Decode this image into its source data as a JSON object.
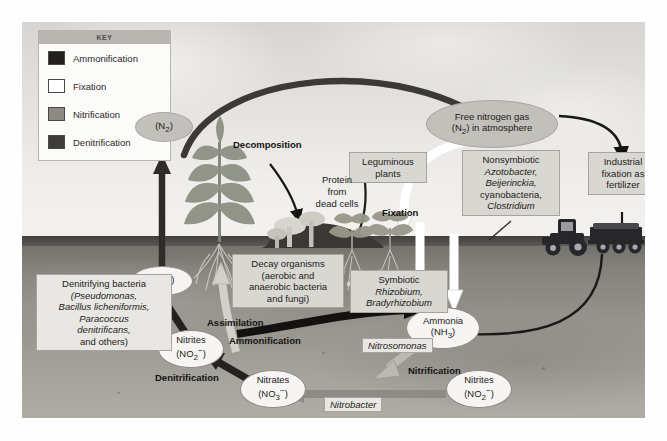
{
  "figure": {
    "key": {
      "title": "KEY",
      "items": [
        {
          "label": "Ammonification",
          "color": "#222120"
        },
        {
          "label": "Fixation",
          "color": "#ffffff"
        },
        {
          "label": "Nitrification",
          "color": "#8d8a85"
        },
        {
          "label": "Denitrification",
          "color": "#3f3d3a"
        }
      ]
    },
    "nodes": {
      "free_nitrogen": "Free nitrogen gas\n(N2) in atmosphere",
      "free_nitrogen_l1": "Free nitrogen gas",
      "free_nitrogen_l2a": "(N",
      "free_nitrogen_sub": "2",
      "free_nitrogen_l2b": ") in atmosphere",
      "n2_left_a": "(N",
      "n2_left_sub": "2",
      "n2_left_b": ")",
      "n2o_a": "(N",
      "n2o_sub": "2",
      "n2o_b": "O)",
      "ammonia_l1": "Ammonia",
      "ammonia_l2a": "(NH",
      "ammonia_sub": "3",
      "ammonia_l2b": ")",
      "nitrites_left_l1": "Nitrites",
      "nitrites_left_l2a": "(NO",
      "nitrites_left_sub": "2",
      "nitrites_left_sup": "−",
      "nitrites_left_l2b": ")",
      "nitrates_l1": "Nitrates",
      "nitrates_l2a": "(NO",
      "nitrates_sub": "3",
      "nitrates_sup": "−",
      "nitrates_l2b": ")",
      "nitrites_right_l1": "Nitrites",
      "nitrites_right_l2a": "(NO",
      "nitrites_right_sub": "2",
      "nitrites_right_sup": "−",
      "nitrites_right_l2b": ")"
    },
    "boxes": {
      "leguminous": "Leguminous\nplants",
      "leguminous_l1": "Leguminous",
      "leguminous_l2": "plants",
      "nonsymbiotic_l1": "Nonsymbiotic",
      "nonsymbiotic_l2": "Azotobacter,",
      "nonsymbiotic_l3": "Beijerinckia,",
      "nonsymbiotic_l4": "cyanobacteria,",
      "nonsymbiotic_l5": "Clostridium",
      "industrial_l1": "Industrial",
      "industrial_l2": "fixation as",
      "industrial_l3": "fertilizer",
      "decay_l1": "Decay organisms",
      "decay_l2": "(aerobic and",
      "decay_l3": "anaerobic bacteria",
      "decay_l4": "and fungi)",
      "symbiotic_l1": "Symbiotic",
      "symbiotic_l2": "Rhizobium,",
      "symbiotic_l3": "Bradyrhizobium",
      "denitrifying_l1": "Denitrifying bacteria",
      "denitrifying_l2": "(Pseudomonas,",
      "denitrifying_l3": "Bacillus licheniformis,",
      "denitrifying_l4": "Paracoccus",
      "denitrifying_l5": "denitrificans,",
      "denitrifying_l6": "and others)",
      "protein_l1": "Protein",
      "protein_l2": "from",
      "protein_l3": "dead cells"
    },
    "processes": {
      "decomposition": "Decomposition",
      "fixation": "Fixation",
      "assimilation": "Assimilation",
      "ammonification": "Ammonification",
      "denitrification": "Denitrification",
      "nitrification": "Nitrification"
    },
    "organisms": {
      "nitrosomonas": "Nitrosomonas",
      "nitrobacter": "Nitrobacter"
    },
    "colors": {
      "sky": "#e3e1dd",
      "soil": "#95918b",
      "ammonification_arrow": "#222120",
      "fixation_arrow": "#ffffff",
      "nitrification_arrow": "#8d8a85",
      "denitrification_arrow": "#3f3d3a",
      "thin_arrow": "#1a1917"
    }
  }
}
